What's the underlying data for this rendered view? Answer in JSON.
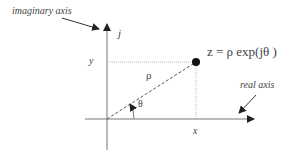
{
  "diagram": {
    "type": "complex-plane",
    "labels": {
      "imaginary_axis": "imaginary axis",
      "real_axis": "real axis",
      "j": "j",
      "y": "y",
      "x": "x",
      "rho": "ρ",
      "theta": "θ",
      "equation": "z = ρ exp(jθ )"
    },
    "colors": {
      "axis": "#555555",
      "point": "#111111",
      "text": "#444444"
    }
  }
}
